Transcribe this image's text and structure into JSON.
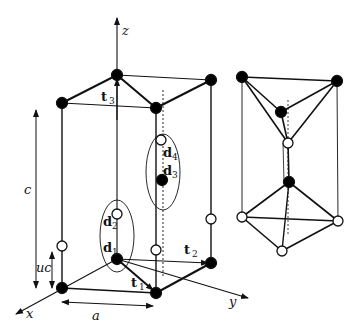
{
  "figure": {
    "colors": {
      "line": "#111111",
      "filled_atom": "#000000",
      "open_atom": "#ffffff",
      "background": "#ffffff"
    }
  },
  "axes": {
    "x_label": "x",
    "y_label": "y",
    "z_label": "z"
  },
  "lattice_vectors": {
    "t1": {
      "symbol": "t",
      "index": "1"
    },
    "t2": {
      "symbol": "t",
      "index": "2"
    },
    "t3": {
      "symbol": "t",
      "index": "3"
    }
  },
  "basis_atoms": {
    "d1": {
      "symbol": "d",
      "index": "1",
      "type": "filled"
    },
    "d2": {
      "symbol": "d",
      "index": "2",
      "type": "open"
    },
    "d3": {
      "symbol": "d",
      "index": "3",
      "type": "filled"
    },
    "d4": {
      "symbol": "d",
      "index": "4",
      "type": "open"
    }
  },
  "dimensions": {
    "c_label": "c",
    "uc_label": "uc",
    "a_label": "a"
  },
  "legend": {
    "filled_atom": "cation site (filled circle)",
    "open_atom": "anion site (open circle)"
  }
}
